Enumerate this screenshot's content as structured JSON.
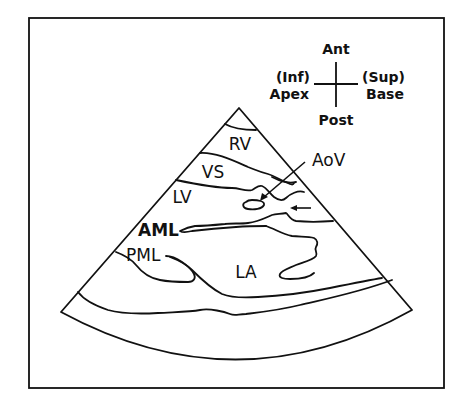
{
  "figure": {
    "type": "echocardiogram-parasternal-long-axis-schematic",
    "orientation": {
      "top": "Ant",
      "bottom": "Post",
      "left_line1": "(Inf)",
      "left_line2": "Apex",
      "right_line1": "(Sup)",
      "right_line2": "Base"
    },
    "labels": {
      "rv": "RV",
      "vs": "VS",
      "lv": "LV",
      "aov": "AoV",
      "aml": "AML",
      "pml": "PML",
      "la": "LA"
    },
    "colors": {
      "line": "#111111",
      "background": "#ffffff"
    }
  }
}
